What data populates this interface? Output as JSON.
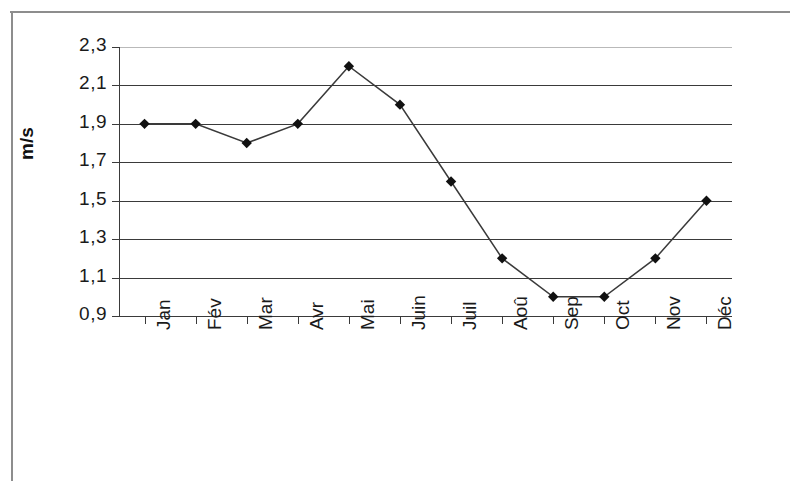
{
  "chart_data": {
    "type": "line",
    "title": "",
    "subtitle": "",
    "xlabel": "",
    "ylabel": "m/s",
    "categories": [
      "Jan",
      "Fév",
      "Mar",
      "Avr",
      "Mai",
      "Juin",
      "Juil",
      "Aoû",
      "Sep",
      "Oct",
      "Nov",
      "Déc"
    ],
    "values": [
      1.9,
      1.9,
      1.8,
      1.9,
      2.2,
      2.0,
      1.6,
      1.2,
      1.0,
      1.0,
      1.2,
      1.5
    ],
    "series": [
      {
        "name": "",
        "values": [
          1.9,
          1.9,
          1.8,
          1.9,
          2.2,
          2.0,
          1.6,
          1.2,
          1.0,
          1.0,
          1.2,
          1.5
        ]
      }
    ],
    "ylim": [
      0.9,
      2.3
    ],
    "ytick_labels": [
      "2,3",
      "2,1",
      "1,9",
      "1,7",
      "1,5",
      "1,3",
      "1,1",
      "0,9"
    ],
    "ytick_values": [
      2.3,
      2.1,
      1.9,
      1.7,
      1.5,
      1.3,
      1.1,
      0.9
    ],
    "grid": true,
    "legend": false,
    "legend_position": "none",
    "marker": "diamond",
    "line_color": "#3a3a3a",
    "marker_color": "#111111",
    "grid_color": "#3a3a3a",
    "background_color": "#ffffff",
    "decimal_separator": ","
  },
  "axis": {
    "y_title": "m/s"
  }
}
